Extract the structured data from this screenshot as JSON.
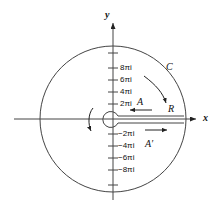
{
  "figure": {
    "axes": {
      "x_label": "x",
      "y_label": "y"
    },
    "colors": {
      "stroke": "#333333",
      "text": "#111111",
      "background": "#ffffff"
    },
    "y_ticks_positive": [
      {
        "label": "8πi",
        "value": 8
      },
      {
        "label": "6πi",
        "value": 6
      },
      {
        "label": "4πi",
        "value": 4
      },
      {
        "label": "2πi",
        "value": 2
      }
    ],
    "y_ticks_negative": [
      {
        "label": "−2πi",
        "value": -2
      },
      {
        "label": "−4πi",
        "value": -4
      },
      {
        "label": "−6πi",
        "value": -6
      },
      {
        "label": "−8πi",
        "value": -8
      }
    ],
    "annotations": [
      {
        "name": "contour-label",
        "text": "C"
      },
      {
        "name": "radius-label",
        "text": "R"
      },
      {
        "name": "upper-cut-label",
        "text": "A"
      },
      {
        "name": "lower-cut-label",
        "text": "A′"
      }
    ]
  }
}
